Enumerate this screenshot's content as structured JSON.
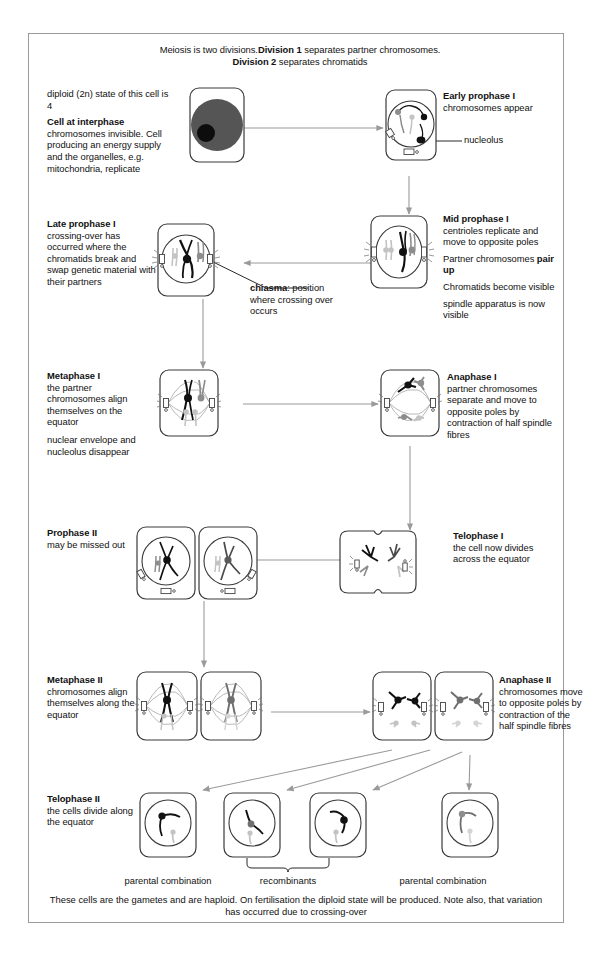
{
  "title_line1_a": "Meiosis is two divisions.",
  "title_line1_b": "Division 1",
  "title_line1_c": "separates partner chromosomes.",
  "title_line2_a": "Division 2",
  "title_line2_b": "separates chromatids",
  "stages": {
    "interphase": {
      "pre": "diploid (2n) state of this cell is 4",
      "heading": "Cell at interphase",
      "body": "chromosomes invisible. Cell producing an energy supply and the organelles, e.g. mitochondria, replicate"
    },
    "early_prophase_1": {
      "heading": "Early prophase I",
      "body": "chromosomes appear",
      "callout": "nucleolus"
    },
    "mid_prophase_1": {
      "heading": "Mid prophase I",
      "body1": "centrioles replicate and move to opposite poles",
      "body2a": "Partner chromosomes",
      "body2b": "pair up",
      "body3": "Chromatids become visible",
      "body4": "spindle apparatus is now visible"
    },
    "late_prophase_1": {
      "heading": "Late prophase I",
      "body": "crossing-over has occurred where the chromatids break and swap genetic material with their partners",
      "callout_bold": "chiasma",
      "callout_rest": ": position where crossing over occurs"
    },
    "metaphase_1": {
      "heading": "Metaphase I",
      "body1": "the partner chromosomes align themselves on the equator",
      "body2": "nuclear envelope and nucleolus disappear"
    },
    "anaphase_1": {
      "heading": "Anaphase I",
      "body": "partner chromosomes separate and move to opposite poles by contraction of half spindle fibres"
    },
    "telophase_1": {
      "heading": "Telophase I",
      "body": "the cell now divides across the equator"
    },
    "prophase_2": {
      "heading": "Prophase II",
      "body": "may be missed out"
    },
    "metaphase_2": {
      "heading": "Metaphase II",
      "body": "chromosomes align themselves along the equator"
    },
    "anaphase_2": {
      "heading": "Anaphase II",
      "body": "chromosomes move to opposite poles by contraction of the half spindle fibres"
    },
    "telophase_2": {
      "heading": "Telophase II",
      "body": "the cells divide along the equator"
    }
  },
  "footer": {
    "label_left": "parental combination",
    "label_mid": "recombinants",
    "label_right": "parental combination",
    "summary_line1": "These cells are the gametes and are haploid. On fertilisation the diploid state will be produced. Note also, that variation",
    "summary_line2": "has occurred due to crossing-over"
  },
  "colors": {
    "frame": "#9a9a9a",
    "ink": "#111111",
    "arrow": "#9a9a9a",
    "cell_outline": "#3a3a3a",
    "nucleus_fill": "#555555",
    "chromosome_black": "#111111",
    "chromosome_gray": "#8d8d8d",
    "chromosome_lightgray": "#c3c3c3"
  }
}
